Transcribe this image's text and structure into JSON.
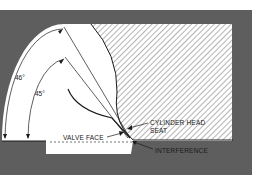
{
  "diagram": {
    "type": "technical-cross-section",
    "colors": {
      "frame": "#5e5e5e",
      "background": "#ffffff",
      "panel": "#ffffff",
      "hatch": "#6a6a6a",
      "line": "#1a1a1a"
    },
    "angles": {
      "outer": "46°",
      "inner": "45°"
    },
    "labels": {
      "cylinder_head_line1": "CYLINDER HEAD",
      "cylinder_head_line2": "SEAT",
      "valve_face": "VALVE FACE",
      "interference": "INTERFERENCE"
    }
  }
}
